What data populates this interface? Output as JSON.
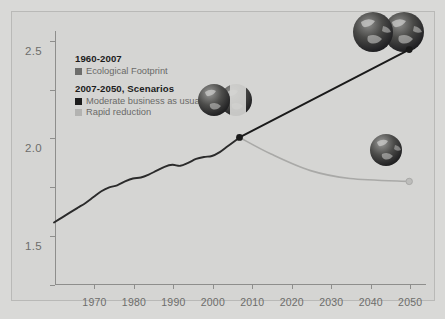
{
  "chart_data": {
    "type": "line",
    "title": "",
    "xlabel": "",
    "ylabel": "",
    "xlim": [
      1960,
      2054
    ],
    "ylim": [
      0.0,
      2.6
    ],
    "grid": false,
    "legend_position": "top-left-inside",
    "y_ticks": [
      "0.0",
      "0.5",
      "1.0",
      "1.5",
      "2.0",
      "2.5"
    ],
    "y_tick_values": [
      0.0,
      0.5,
      1.0,
      1.5,
      2.0,
      2.5
    ],
    "x_ticks": [
      "1970",
      "1980",
      "1990",
      "2000",
      "2010",
      "2020",
      "2030",
      "2040",
      "2050"
    ],
    "x_tick_values": [
      1970,
      1980,
      1990,
      2000,
      2010,
      2020,
      2030,
      2040,
      2050
    ],
    "units_note": "number of planet Earths",
    "series": [
      {
        "name": "Ecological Footprint",
        "period": "1960-2007",
        "color": "#2b2b2b",
        "style": "solid",
        "x": [
          1960,
          1962,
          1964,
          1966,
          1968,
          1970,
          1972,
          1974,
          1976,
          1978,
          1980,
          1982,
          1984,
          1986,
          1988,
          1990,
          1992,
          1994,
          1996,
          1998,
          2000,
          2002,
          2004,
          2006,
          2007
        ],
        "values": [
          0.63,
          0.68,
          0.73,
          0.78,
          0.83,
          0.89,
          0.95,
          0.99,
          1.01,
          1.05,
          1.08,
          1.09,
          1.12,
          1.16,
          1.2,
          1.22,
          1.21,
          1.24,
          1.28,
          1.3,
          1.31,
          1.35,
          1.41,
          1.47,
          1.5
        ]
      },
      {
        "name": "Moderate business as usual",
        "period": "2007-2050",
        "color": "#1a1a1a",
        "style": "solid",
        "x": [
          2007,
          2050
        ],
        "values": [
          1.5,
          2.4
        ]
      },
      {
        "name": "Rapid reduction",
        "period": "2007-2050",
        "color": "#a9a9a7",
        "style": "solid",
        "x": [
          2007,
          2015,
          2025,
          2035,
          2050
        ],
        "values": [
          1.5,
          1.33,
          1.16,
          1.08,
          1.05
        ]
      }
    ],
    "annotations": [
      {
        "name": "globe-cluster-top-right",
        "label": "two Earths",
        "count": 2,
        "near_value": 2.4,
        "near_year": 2050
      },
      {
        "name": "globe-cluster-middle",
        "label": "one and a half Earths",
        "count": 1.5,
        "near_value": 1.5,
        "near_year": 2007
      },
      {
        "name": "globe-single-lower-right",
        "label": "one Earth",
        "count": 1,
        "near_value": 1.05,
        "near_year": 2050
      }
    ]
  },
  "legend": {
    "group_one_title": "1960-2007",
    "group_one_items": [
      {
        "label": "Ecological Footprint",
        "color": "#6d6d6b"
      }
    ],
    "group_two_title": "2007-2050, Scenarios",
    "group_two_items": [
      {
        "label": "Moderate business as usual",
        "color": "#1c1c1c"
      },
      {
        "label": "Rapid reduction",
        "color": "#b3b3b1"
      }
    ]
  },
  "colors": {
    "page_background": "#d9d9d7",
    "panel_background": "#d5d5d3",
    "axis": "#8e8e8c",
    "tick_text": "#6d6d6b",
    "historical_line": "#2b2b2b",
    "scenario_business": "#1a1a1a",
    "scenario_rapid": "#a9a9a7"
  }
}
